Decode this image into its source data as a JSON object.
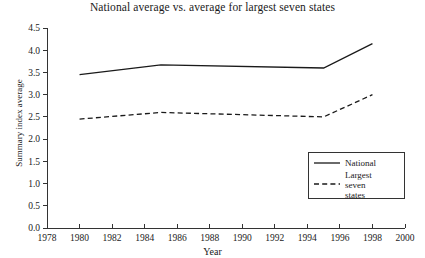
{
  "chart_data": {
    "type": "line",
    "title": "National average vs. average for largest seven states",
    "xlabel": "Year",
    "ylabel": "Summary index average",
    "xlim": [
      1978,
      2000
    ],
    "ylim": [
      0.0,
      4.5
    ],
    "grid": false,
    "legend_position": "bottom-right",
    "xticks": [
      "1978",
      "1980",
      "1982",
      "1984",
      "1986",
      "1988",
      "1990",
      "1992",
      "1994",
      "1996",
      "1998",
      "2000"
    ],
    "yticks": [
      "0.0",
      "0.5",
      "1.0",
      "1.5",
      "2.0",
      "2.5",
      "3.0",
      "3.5",
      "4.0",
      "4.5"
    ],
    "x": [
      1980,
      1985,
      1995,
      1998
    ],
    "series": [
      {
        "name": "National",
        "style": "solid",
        "values": [
          3.45,
          3.67,
          3.6,
          4.15
        ]
      },
      {
        "name": "Largest seven states",
        "style": "dashed",
        "values": [
          2.45,
          2.6,
          2.5,
          3.0
        ]
      }
    ]
  },
  "legend": {
    "entries": [
      {
        "label": "National"
      },
      {
        "label": "Largest seven states"
      }
    ]
  }
}
